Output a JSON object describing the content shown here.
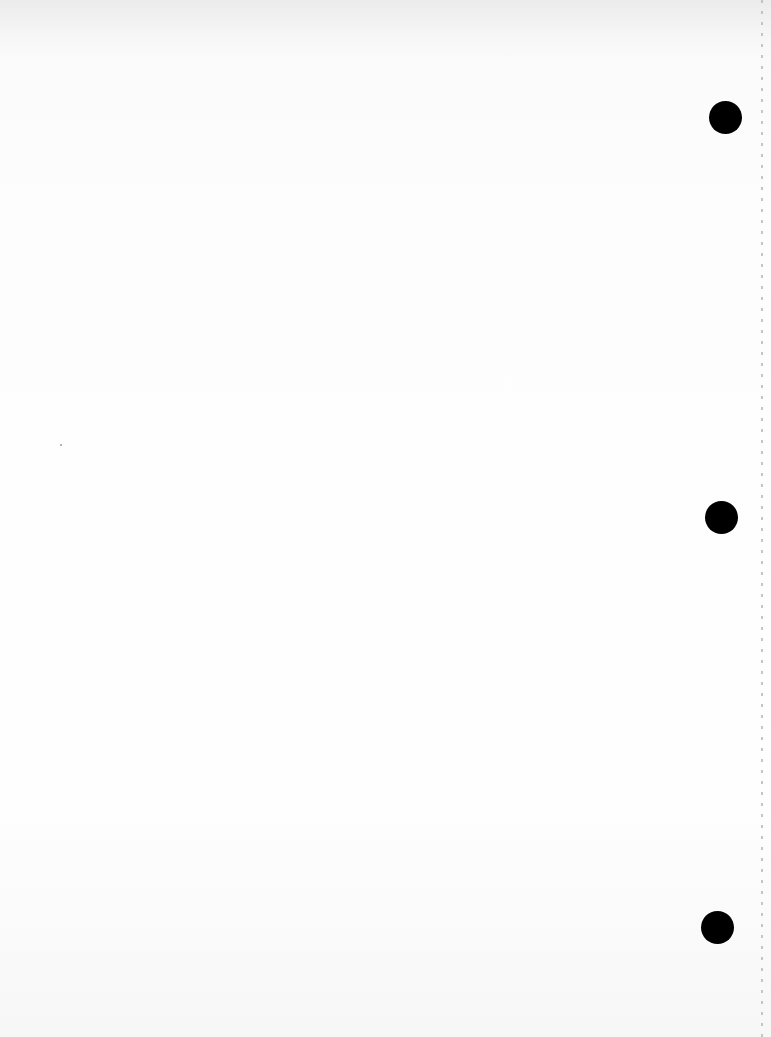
{
  "document": {
    "type": "blank scanned sheet",
    "text": "",
    "holes": [
      {
        "cx": 725,
        "cy": 117
      },
      {
        "cx": 721,
        "cy": 517
      },
      {
        "cx": 717,
        "cy": 927
      }
    ],
    "hole_color": "#000000",
    "paper_color": "#fdfdfd"
  }
}
